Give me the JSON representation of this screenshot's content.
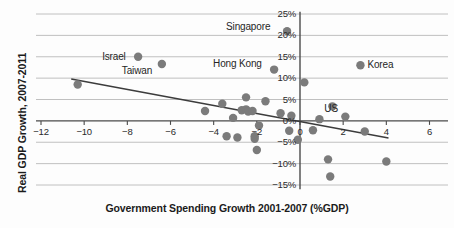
{
  "chart_data": {
    "type": "scatter",
    "title": "",
    "xlabel": "Government Spending Growth 2001-2007 (%GDP)",
    "ylabel": "Real GDP Growth, 2007-2011",
    "xlim": [
      -13,
      6.6
    ],
    "ylim": [
      -16.5,
      26
    ],
    "xticks": [
      -12,
      -10,
      -8,
      -6,
      -4,
      -2,
      0,
      2,
      4,
      6
    ],
    "xticklabels": [
      "−12",
      "−10",
      "−8",
      "−6",
      "−4",
      "−2",
      "0",
      "2",
      "4",
      "6"
    ],
    "yticks": [
      25,
      20,
      15,
      10,
      5,
      0,
      -5,
      -10,
      -15
    ],
    "yticklabels": [
      "25%",
      "20%",
      "15%",
      "10%",
      "5%",
      "0%",
      "−5%",
      "−10%",
      "−15%"
    ],
    "grid": "horizontal",
    "grid_color": "#b9b9b9",
    "axis_color": "#4a4a4a",
    "marker_color": "#7b7b7b",
    "trendline_color": "#3c3c3c",
    "legend": "none",
    "marker_radius_px": 4.2,
    "points": [
      {
        "x": -10.3,
        "y": 8.5,
        "label": ""
      },
      {
        "x": -7.5,
        "y": 15.0,
        "label": "Israel"
      },
      {
        "x": -6.4,
        "y": 13.3,
        "label": "Taiwan"
      },
      {
        "x": -4.4,
        "y": 2.3,
        "label": ""
      },
      {
        "x": -3.6,
        "y": 4.0,
        "label": ""
      },
      {
        "x": -3.4,
        "y": -3.6,
        "label": ""
      },
      {
        "x": -3.1,
        "y": 0.7,
        "label": ""
      },
      {
        "x": -2.9,
        "y": -3.9,
        "label": ""
      },
      {
        "x": -2.7,
        "y": 2.5,
        "label": ""
      },
      {
        "x": -2.5,
        "y": 5.5,
        "label": ""
      },
      {
        "x": -2.5,
        "y": 2.7,
        "label": ""
      },
      {
        "x": -2.4,
        "y": 2.2,
        "label": ""
      },
      {
        "x": -2.2,
        "y": 2.3,
        "label": ""
      },
      {
        "x": -2.1,
        "y": -3.6,
        "label": ""
      },
      {
        "x": -2.1,
        "y": -4.2,
        "label": ""
      },
      {
        "x": -2.0,
        "y": -6.8,
        "label": ""
      },
      {
        "x": -1.9,
        "y": -1.1,
        "label": ""
      },
      {
        "x": -1.6,
        "y": 4.6,
        "label": ""
      },
      {
        "x": -1.2,
        "y": 12.0,
        "label": "Hong Kong"
      },
      {
        "x": -0.9,
        "y": 1.8,
        "label": ""
      },
      {
        "x": -0.6,
        "y": 21.0,
        "label": "Singapore"
      },
      {
        "x": -0.5,
        "y": -2.3,
        "label": ""
      },
      {
        "x": -0.4,
        "y": 1.2,
        "label": ""
      },
      {
        "x": 0.2,
        "y": 9.0,
        "label": ""
      },
      {
        "x": -0.1,
        "y": -4.4,
        "label": ""
      },
      {
        "x": 0.6,
        "y": -2.2,
        "label": ""
      },
      {
        "x": 0.9,
        "y": 0.4,
        "label": ""
      },
      {
        "x": 1.3,
        "y": -9.0,
        "label": ""
      },
      {
        "x": 1.4,
        "y": -13.0,
        "label": ""
      },
      {
        "x": 1.5,
        "y": 3.4,
        "label": ""
      },
      {
        "x": 2.1,
        "y": 1.0,
        "label": "US"
      },
      {
        "x": 2.8,
        "y": 13.0,
        "label": "Korea"
      },
      {
        "x": 3.0,
        "y": -2.5,
        "label": ""
      },
      {
        "x": 4.0,
        "y": -9.5,
        "label": ""
      }
    ],
    "trendline": {
      "x0": -10.6,
      "y0": 9.8,
      "x1": 4.1,
      "y1": -4.0
    }
  },
  "labels": {
    "israel": "Israel",
    "taiwan": "Taiwan",
    "hong_kong": "Hong Kong",
    "singapore": "Singapore",
    "korea": "Korea",
    "us": "US"
  }
}
